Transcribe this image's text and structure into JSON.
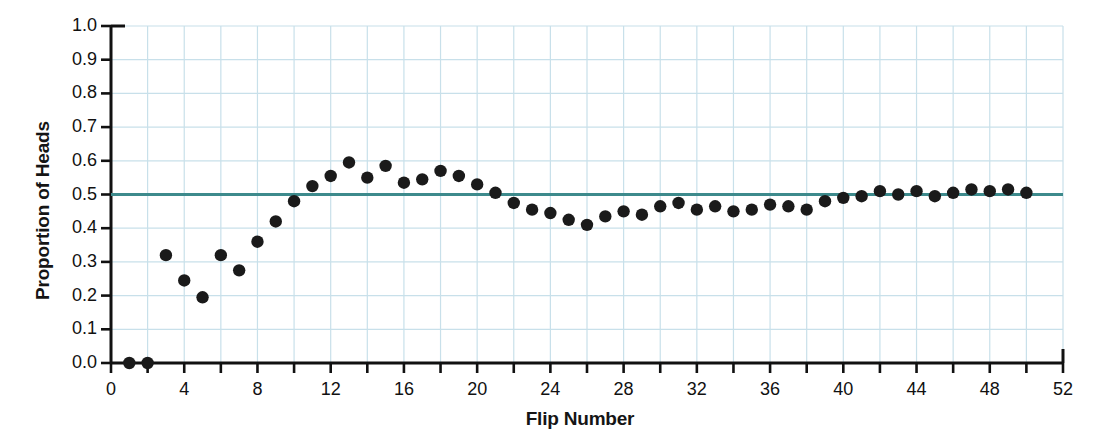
{
  "chart_data": {
    "type": "scatter",
    "title": "",
    "xlabel": "Flip Number",
    "ylabel": "Proportion of Heads",
    "xlim": [
      0,
      52
    ],
    "ylim": [
      0.0,
      1.0
    ],
    "grid": true,
    "legend": "none",
    "xticks": [
      0,
      2,
      4,
      6,
      8,
      10,
      12,
      14,
      16,
      18,
      20,
      22,
      24,
      26,
      28,
      30,
      32,
      34,
      36,
      38,
      40,
      42,
      44,
      46,
      48,
      50,
      52
    ],
    "xtick_labels": [
      "0",
      "",
      "4",
      "",
      "8",
      "",
      "12",
      "",
      "16",
      "",
      "20",
      "",
      "24",
      "",
      "28",
      "",
      "32",
      "",
      "36",
      "",
      "40",
      "",
      "44",
      "",
      "48",
      "",
      "52"
    ],
    "yticks": [
      0.0,
      0.1,
      0.2,
      0.3,
      0.4,
      0.5,
      0.6,
      0.7,
      0.8,
      0.9,
      1.0
    ],
    "ytick_labels": [
      "0.0",
      "0.1",
      "0.2",
      "0.3",
      "0.4",
      "0.5",
      "0.6",
      "0.7",
      "0.8",
      "0.9",
      "1.0"
    ],
    "reference_line": {
      "label": "0.5 reference line",
      "y": 0.5,
      "color": "#3d8a8c"
    },
    "marker_color": "#1a1a1a",
    "grid_color": "#c8e0ea",
    "axis_color": "#111111",
    "series": [
      {
        "name": "Proportion of Heads",
        "x": [
          1,
          2,
          3,
          4,
          5,
          6,
          7,
          8,
          9,
          10,
          11,
          12,
          13,
          14,
          15,
          16,
          17,
          18,
          19,
          20,
          21,
          22,
          23,
          24,
          25,
          26,
          27,
          28,
          29,
          30,
          31,
          32,
          33,
          34,
          35,
          36,
          37,
          38,
          39,
          40,
          41,
          42,
          43,
          44,
          45,
          46,
          47,
          48,
          49,
          50
        ],
        "values": [
          0.0,
          0.0,
          0.32,
          0.245,
          0.195,
          0.32,
          0.275,
          0.36,
          0.42,
          0.48,
          0.525,
          0.555,
          0.595,
          0.55,
          0.585,
          0.535,
          0.545,
          0.57,
          0.555,
          0.53,
          0.505,
          0.475,
          0.455,
          0.445,
          0.425,
          0.41,
          0.435,
          0.45,
          0.44,
          0.465,
          0.475,
          0.455,
          0.465,
          0.45,
          0.455,
          0.47,
          0.465,
          0.455,
          0.48,
          0.49,
          0.495,
          0.51,
          0.5,
          0.51,
          0.495,
          0.505,
          0.515,
          0.51,
          0.515,
          0.505
        ]
      }
    ]
  }
}
